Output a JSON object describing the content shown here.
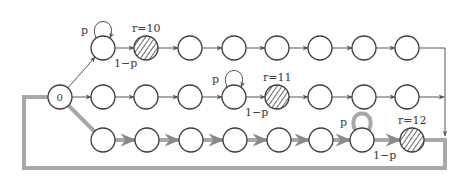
{
  "diagram": {
    "type": "markov-chain",
    "colors": {
      "stroke": "#3c3c3c",
      "thick_path": "#a8a8a8",
      "hatch": "#6a6a6a",
      "background": "#ffffff"
    },
    "start_node": {
      "id": "0",
      "label": "0",
      "x": 60,
      "y": 97
    },
    "rows": [
      {
        "id": "row-1",
        "y": 48,
        "highlighted": false,
        "nodes_x": [
          103,
          146,
          190,
          234,
          277,
          320,
          364,
          407
        ],
        "self_loop_index": 0,
        "loop_label": "p",
        "transition_label": "1−p",
        "reward_index": 1,
        "reward_label": "r=10"
      },
      {
        "id": "row-2",
        "y": 97,
        "highlighted": false,
        "nodes_x": [
          103,
          146,
          190,
          234,
          277,
          320,
          364,
          407
        ],
        "self_loop_index": 3,
        "loop_label": "p",
        "transition_label": "1−p",
        "reward_index": 4,
        "reward_label": "r=11"
      },
      {
        "id": "row-3",
        "y": 140,
        "highlighted": true,
        "nodes_x": [
          103,
          147,
          191,
          235,
          279,
          321,
          362,
          412
        ],
        "self_loop_index": 6,
        "loop_label": "p",
        "transition_label": "1−p",
        "reward_index": 7,
        "reward_label": "r=12"
      }
    ],
    "return_path": {
      "right_x": 445,
      "bottom_y": 168,
      "left_x": 24
    }
  }
}
